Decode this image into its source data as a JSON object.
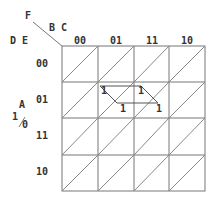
{
  "kmap": {
    "labels": {
      "var_f": "F",
      "var_bc": "B C",
      "var_de": "D E",
      "var_a": "A",
      "a_one": "1",
      "a_zero": "0"
    },
    "columns": [
      "00",
      "01",
      "11",
      "10"
    ],
    "rows": [
      "00",
      "01",
      "11",
      "10"
    ],
    "ones": [
      {
        "row": "01",
        "col": "01",
        "half": "upper",
        "value": "1"
      },
      {
        "row": "01",
        "col": "11",
        "half": "upper",
        "value": "1"
      },
      {
        "row": "01",
        "col": "01",
        "half": "lower",
        "value": "1"
      },
      {
        "row": "01",
        "col": "11",
        "half": "lower",
        "value": "1"
      }
    ],
    "colors": {
      "grid": "#777777",
      "text": "#333333",
      "group_outline": "#555555"
    }
  }
}
